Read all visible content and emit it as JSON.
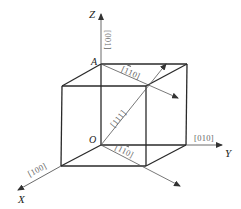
{
  "diagram": {
    "colors": {
      "edge": "#2a2a2a",
      "arrow": "#555555",
      "label": "#666666"
    },
    "axes": {
      "z": {
        "label": "Z"
      },
      "y": {
        "label": "Y"
      },
      "x": {
        "label": "X"
      }
    },
    "points": {
      "a": {
        "label": "A"
      },
      "o": {
        "label": "O"
      }
    },
    "directions": [
      {
        "id": "001",
        "label": "[001]"
      },
      {
        "id": "010",
        "label": "[010]"
      },
      {
        "id": "100",
        "label": "[100]"
      },
      {
        "id": "111",
        "label": "[111]"
      },
      {
        "id": "110_top",
        "label_parts": [
          "[",
          "1",
          "10]"
        ],
        "bar_index": 1
      },
      {
        "id": "110_bottom",
        "label_parts": [
          "[1",
          "1",
          "0]"
        ],
        "bar_index": 1
      }
    ]
  }
}
